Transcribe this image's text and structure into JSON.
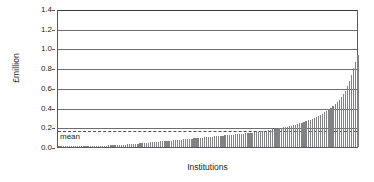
{
  "chart_data": {
    "type": "bar",
    "title": "",
    "subtitle": "",
    "xlabel": "Institutions",
    "ylabel": "£million",
    "ylim": [
      0.0,
      1.4
    ],
    "yticks": [
      0.0,
      0.2,
      0.4,
      0.6,
      0.8,
      1.0,
      1.2,
      1.4
    ],
    "ytick_labels": [
      "0.0",
      "0.2",
      "0.4",
      "0.6",
      "0.8",
      "1.0",
      "1.2",
      "1.4"
    ],
    "xtick_labels": [],
    "grid": "horizontal",
    "legend": "none",
    "bar_color": "#808285",
    "axis_color": "#58595b",
    "gridline_color": "#6d6e71",
    "sorted": "ascending",
    "annotations": [
      {
        "name": "mean",
        "label": "mean",
        "value": 0.17,
        "style": "dashed-horizontal-line"
      }
    ],
    "series_name": "Income per institution",
    "n_categories": 145,
    "categories": [
      "1",
      "2",
      "3",
      "4",
      "5",
      "6",
      "7",
      "8",
      "9",
      "10",
      "11",
      "12",
      "13",
      "14",
      "15",
      "16",
      "17",
      "18",
      "19",
      "20",
      "21",
      "22",
      "23",
      "24",
      "25",
      "26",
      "27",
      "28",
      "29",
      "30",
      "31",
      "32",
      "33",
      "34",
      "35",
      "36",
      "37",
      "38",
      "39",
      "40",
      "41",
      "42",
      "43",
      "44",
      "45",
      "46",
      "47",
      "48",
      "49",
      "50",
      "51",
      "52",
      "53",
      "54",
      "55",
      "56",
      "57",
      "58",
      "59",
      "60",
      "61",
      "62",
      "63",
      "64",
      "65",
      "66",
      "67",
      "68",
      "69",
      "70",
      "71",
      "72",
      "73",
      "74",
      "75",
      "76",
      "77",
      "78",
      "79",
      "80",
      "81",
      "82",
      "83",
      "84",
      "85",
      "86",
      "87",
      "88",
      "89",
      "90",
      "91",
      "92",
      "93",
      "94",
      "95",
      "96",
      "97",
      "98",
      "99",
      "100",
      "101",
      "102",
      "103",
      "104",
      "105",
      "106",
      "107",
      "108",
      "109",
      "110",
      "111",
      "112",
      "113",
      "114",
      "115",
      "116",
      "117",
      "118",
      "119",
      "120",
      "121",
      "122",
      "123",
      "124",
      "125",
      "126",
      "127",
      "128",
      "129",
      "130",
      "131",
      "132",
      "133",
      "134",
      "135",
      "136",
      "137",
      "138",
      "139",
      "140",
      "141",
      "142",
      "143",
      "144",
      "145"
    ],
    "values": [
      0.002,
      0.003,
      0.003,
      0.004,
      0.004,
      0.005,
      0.005,
      0.006,
      0.006,
      0.007,
      0.007,
      0.008,
      0.008,
      0.009,
      0.009,
      0.01,
      0.01,
      0.011,
      0.012,
      0.012,
      0.013,
      0.014,
      0.014,
      0.015,
      0.016,
      0.017,
      0.018,
      0.019,
      0.02,
      0.021,
      0.022,
      0.023,
      0.024,
      0.026,
      0.027,
      0.029,
      0.03,
      0.032,
      0.034,
      0.036,
      0.038,
      0.04,
      0.042,
      0.044,
      0.046,
      0.048,
      0.05,
      0.052,
      0.054,
      0.056,
      0.058,
      0.06,
      0.062,
      0.064,
      0.066,
      0.068,
      0.07,
      0.072,
      0.074,
      0.076,
      0.078,
      0.08,
      0.082,
      0.084,
      0.086,
      0.088,
      0.09,
      0.092,
      0.094,
      0.096,
      0.098,
      0.1,
      0.102,
      0.104,
      0.106,
      0.108,
      0.11,
      0.112,
      0.114,
      0.116,
      0.118,
      0.12,
      0.122,
      0.124,
      0.126,
      0.128,
      0.13,
      0.132,
      0.134,
      0.136,
      0.138,
      0.14,
      0.143,
      0.146,
      0.149,
      0.152,
      0.155,
      0.158,
      0.161,
      0.164,
      0.167,
      0.17,
      0.174,
      0.178,
      0.182,
      0.186,
      0.19,
      0.194,
      0.198,
      0.202,
      0.207,
      0.212,
      0.217,
      0.222,
      0.228,
      0.234,
      0.24,
      0.247,
      0.254,
      0.262,
      0.27,
      0.278,
      0.287,
      0.296,
      0.306,
      0.316,
      0.327,
      0.339,
      0.352,
      0.366,
      0.381,
      0.397,
      0.414,
      0.433,
      0.454,
      0.478,
      0.505,
      0.536,
      0.572,
      0.615,
      0.668,
      0.735,
      0.8,
      0.86,
      0.93
    ]
  }
}
